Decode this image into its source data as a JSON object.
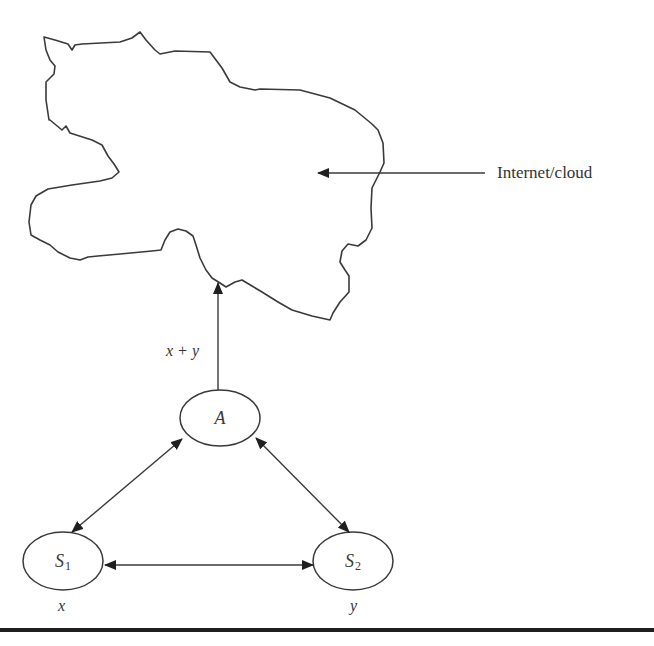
{
  "diagram": {
    "cloud": {
      "label": "Internet/cloud",
      "stroke_color": "#3a3a3a"
    },
    "uplink": {
      "label": "x + y"
    },
    "nodes": {
      "A": {
        "label": "A",
        "sub": ""
      },
      "S1": {
        "label": "S",
        "sub": "1",
        "load_label": "x"
      },
      "S2": {
        "label": "S",
        "sub": "2",
        "load_label": "y"
      }
    },
    "edges": [
      {
        "from": "A",
        "to": "Internet/cloud",
        "direction": "uni",
        "label": "x + y"
      },
      {
        "from": "A",
        "to": "S1",
        "direction": "bi"
      },
      {
        "from": "A",
        "to": "S2",
        "direction": "bi"
      },
      {
        "from": "S1",
        "to": "S2",
        "direction": "bi"
      }
    ],
    "colors": {
      "line": "#3a3a3a",
      "arrowhead": "#1f1f1f",
      "bottom_rule": "#1f1f1f",
      "background": "#ffffff"
    }
  }
}
